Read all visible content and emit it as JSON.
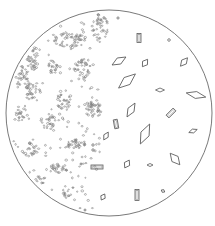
{
  "canvas": {
    "width": 215,
    "height": 226,
    "background": "#ffffff"
  },
  "colors": {
    "ink": "#5a5a5a",
    "field_outline": "#6a6a6a",
    "granule": "#7a7a7a"
  },
  "field": {
    "cx": 109,
    "cy": 113,
    "r": 103
  },
  "crystals": {
    "diamonds": [
      {
        "cx": 119,
        "cy": 61,
        "w": 16,
        "h": 7,
        "rot": -30
      },
      {
        "cx": 145,
        "cy": 63,
        "w": 9,
        "h": 6,
        "rot": -55
      },
      {
        "cx": 184,
        "cy": 62,
        "w": 11,
        "h": 6,
        "rot": -50
      },
      {
        "cx": 127,
        "cy": 81,
        "w": 22,
        "h": 9,
        "rot": -40
      },
      {
        "cx": 160,
        "cy": 90,
        "w": 9,
        "h": 4,
        "rot": 0
      },
      {
        "cx": 196,
        "cy": 95,
        "w": 20,
        "h": 7,
        "rot": 12
      },
      {
        "cx": 131,
        "cy": 110,
        "w": 16,
        "h": 7,
        "rot": -60
      },
      {
        "cx": 145,
        "cy": 134,
        "w": 22,
        "h": 9,
        "rot": -65
      },
      {
        "cx": 193,
        "cy": 131,
        "w": 9,
        "h": 4,
        "rot": -20
      },
      {
        "cx": 106,
        "cy": 136,
        "w": 9,
        "h": 5,
        "rot": -60
      },
      {
        "cx": 127,
        "cy": 164,
        "w": 9,
        "h": 6,
        "rot": -60
      },
      {
        "cx": 150,
        "cy": 165,
        "w": 6,
        "h": 3,
        "rot": 0
      },
      {
        "cx": 175,
        "cy": 159,
        "w": 15,
        "h": 8,
        "rot": 50
      },
      {
        "cx": 103,
        "cy": 197,
        "w": 7,
        "h": 5,
        "rot": -60
      },
      {
        "cx": 163,
        "cy": 191,
        "w": 4,
        "h": 3,
        "rot": 30
      }
    ],
    "rectangles": [
      {
        "cx": 139,
        "cy": 38,
        "w": 4,
        "h": 9,
        "rot": 0
      },
      {
        "cx": 171,
        "cy": 113,
        "w": 4,
        "h": 10,
        "rot": 45
      },
      {
        "cx": 116,
        "cy": 124,
        "w": 4,
        "h": 9,
        "rot": -10
      },
      {
        "cx": 97,
        "cy": 167,
        "w": 12,
        "h": 4,
        "rot": 0
      },
      {
        "cx": 137,
        "cy": 195,
        "w": 4,
        "h": 11,
        "rot": 0
      }
    ],
    "dots": [
      {
        "cx": 169,
        "cy": 40,
        "r": 1.3
      },
      {
        "cx": 118,
        "cy": 18,
        "r": 1.1
      },
      {
        "cx": 93,
        "cy": 145,
        "r": 1.2
      },
      {
        "cx": 93,
        "cy": 150,
        "r": 1.2
      },
      {
        "cx": 81,
        "cy": 164,
        "r": 1
      },
      {
        "cx": 85,
        "cy": 210,
        "r": 1
      }
    ]
  },
  "granule_clusters": [
    {
      "cx": 100,
      "cy": 28,
      "rx": 8,
      "ry": 14,
      "n": 45
    },
    {
      "cx": 70,
      "cy": 40,
      "rx": 16,
      "ry": 8,
      "n": 50
    },
    {
      "cx": 33,
      "cy": 58,
      "rx": 6,
      "ry": 14,
      "n": 35
    },
    {
      "cx": 22,
      "cy": 78,
      "rx": 7,
      "ry": 12,
      "n": 30
    },
    {
      "cx": 53,
      "cy": 68,
      "rx": 5,
      "ry": 8,
      "n": 20
    },
    {
      "cx": 84,
      "cy": 68,
      "rx": 10,
      "ry": 9,
      "n": 35
    },
    {
      "cx": 33,
      "cy": 92,
      "rx": 8,
      "ry": 10,
      "n": 30
    },
    {
      "cx": 64,
      "cy": 100,
      "rx": 7,
      "ry": 11,
      "n": 30
    },
    {
      "cx": 94,
      "cy": 108,
      "rx": 10,
      "ry": 10,
      "n": 40
    },
    {
      "cx": 22,
      "cy": 112,
      "rx": 6,
      "ry": 8,
      "n": 20
    },
    {
      "cx": 48,
      "cy": 122,
      "rx": 8,
      "ry": 8,
      "n": 25
    },
    {
      "cx": 73,
      "cy": 144,
      "rx": 12,
      "ry": 5,
      "n": 30
    },
    {
      "cx": 30,
      "cy": 150,
      "rx": 8,
      "ry": 7,
      "n": 20
    },
    {
      "cx": 56,
      "cy": 168,
      "rx": 12,
      "ry": 6,
      "n": 25
    },
    {
      "cx": 38,
      "cy": 180,
      "rx": 8,
      "ry": 5,
      "n": 15
    },
    {
      "cx": 70,
      "cy": 193,
      "rx": 8,
      "ry": 6,
      "n": 15
    }
  ],
  "scatter": {
    "n": 140,
    "xmin": 12,
    "xmax": 100,
    "ymin": 20,
    "ymax": 210
  }
}
